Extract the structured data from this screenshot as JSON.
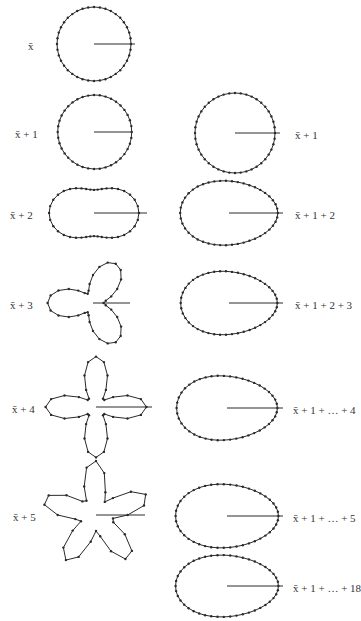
{
  "figure": {
    "stroke_color": "#2a2a2a",
    "point_color": "#2a2a2a"
  },
  "left_column": [
    {
      "label": "x̄",
      "cx": 94,
      "cy": 44,
      "r": 37,
      "harmonic": 0,
      "amp": 0,
      "phase": 0,
      "rotation": 0,
      "points": 40,
      "label_x": 28,
      "label_y": 40,
      "ray_to": 135
    },
    {
      "label": "x̄ + 1",
      "cx": 94,
      "cy": 132,
      "r": 37,
      "harmonic": 1,
      "amp": 0.02,
      "phase": 0,
      "rotation": 0,
      "points": 40,
      "label_x": 15,
      "label_y": 128,
      "ray_to": 132
    },
    {
      "label": "x̄ + 2",
      "cx": 94,
      "cy": 213,
      "r": 34,
      "harmonic": 2,
      "amp": 0.32,
      "phase": 0,
      "rotation": 0,
      "points": 40,
      "label_x": 10,
      "label_y": 209,
      "ray_to": 147
    },
    {
      "label": "x̄ + 3",
      "cx": 93,
      "cy": 303,
      "r": 28,
      "harmonic": 3,
      "amp": 0.62,
      "phase": 0,
      "rotation": 180,
      "points": 36,
      "label_x": 10,
      "label_y": 299,
      "ray_to": 130
    },
    {
      "label": "x̄ + 4",
      "cx": 96,
      "cy": 407,
      "r": 30,
      "harmonic": 4,
      "amp": 0.68,
      "phase": 0,
      "rotation": 0,
      "points": 36,
      "label_x": 12,
      "label_y": 403,
      "ray_to": 152
    },
    {
      "label": "x̄ + 5",
      "cx": 96,
      "cy": 515,
      "r": 35,
      "harmonic": 5,
      "amp": 0.55,
      "phase": 0,
      "rotation": 20,
      "points": 32,
      "label_x": 13,
      "label_y": 511,
      "ray_to": 145
    }
  ],
  "right_column": [
    {
      "label": "x̄ + 1",
      "cx": 235,
      "cy": 133,
      "r": 40,
      "ex": 1.0,
      "ey": 1.0,
      "a2": 0.0,
      "a3": 0.0,
      "points": 44,
      "label_x": 295,
      "label_y": 129,
      "ray_to": 280
    },
    {
      "label": "x̄ + 1 + 2",
      "cx": 229,
      "cy": 213,
      "r": 46,
      "ex": 1.0,
      "ey": 0.74,
      "a2": 0.06,
      "a3": 0.1,
      "points": 46,
      "label_x": 295,
      "label_y": 209,
      "ray_to": 283
    },
    {
      "label": "x̄ + 1 + 2 + 3",
      "cx": 229,
      "cy": 303,
      "r": 46,
      "ex": 1.0,
      "ey": 0.72,
      "a2": 0.05,
      "a3": 0.12,
      "points": 46,
      "label_x": 295,
      "label_y": 299,
      "ray_to": 283
    },
    {
      "label": "x̄ + 1 + … + 4",
      "cx": 227,
      "cy": 408,
      "r": 48,
      "ex": 1.0,
      "ey": 0.7,
      "a2": 0.05,
      "a3": 0.12,
      "points": 46,
      "label_x": 293,
      "label_y": 404,
      "ray_to": 283
    },
    {
      "label": "x̄ + 1 + … + 5",
      "cx": 227,
      "cy": 516,
      "r": 49,
      "ex": 1.0,
      "ey": 0.68,
      "a2": 0.05,
      "a3": 0.1,
      "points": 46,
      "label_x": 293,
      "label_y": 512,
      "ray_to": 283
    },
    {
      "label": "x̄ + 1 + … + 18",
      "cx": 227,
      "cy": 586,
      "r": 49,
      "ex": 1.0,
      "ey": 0.66,
      "a2": 0.05,
      "a3": 0.1,
      "points": 46,
      "label_x": 293,
      "label_y": 582,
      "ray_to": 283
    }
  ]
}
